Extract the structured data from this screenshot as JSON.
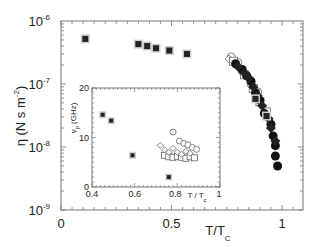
{
  "chart_data": [
    {
      "type": "scatter",
      "title": "",
      "xlabel": "T/T",
      "xlabel_sub": "C",
      "ylabel": "η (N s m",
      "ylabel_sup": "-2",
      "ylabel_close": ")",
      "yscale": "log",
      "xlim": [
        0,
        1.1
      ],
      "ylim": [
        1e-09,
        1e-06
      ],
      "x_ticks": [
        {
          "value": 0,
          "label": "0"
        },
        {
          "value": 0.5,
          "label": "0.5"
        },
        {
          "value": 1,
          "label": "1"
        }
      ],
      "y_ticks": [
        {
          "exp": -6,
          "base": "10",
          "sup": "-6"
        },
        {
          "exp": -7,
          "base": "10",
          "sup": "-7"
        },
        {
          "exp": -8,
          "base": "10",
          "sup": "-8"
        },
        {
          "exp": -9,
          "base": "10",
          "sup": "-9"
        }
      ],
      "grid": false,
      "series": [
        {
          "name": "filled squares (gray outline)",
          "marker": "square-filled",
          "points": [
            [
              0.11,
              5.2e-07
            ],
            [
              0.35,
              4.3e-07
            ],
            [
              0.39,
              4e-07
            ],
            [
              0.43,
              3.7e-07
            ],
            [
              0.49,
              3.4e-07
            ],
            [
              0.57,
              3e-07
            ],
            [
              0.88,
              5.8e-08
            ],
            [
              0.93,
              3.1e-08
            ]
          ]
        },
        {
          "name": "open circles",
          "marker": "circle-open",
          "points": [
            [
              0.77,
              2.7e-07
            ],
            [
              0.8,
              2.2e-07
            ],
            [
              0.82,
              1.6e-07
            ],
            [
              0.86,
              1e-07
            ],
            [
              0.89,
              7.5e-08
            ]
          ]
        },
        {
          "name": "open squares",
          "marker": "square-open",
          "points": [
            [
              0.78,
              2.3e-07
            ],
            [
              0.83,
              1.4e-07
            ],
            [
              0.87,
              8.5e-08
            ],
            [
              0.9,
              5.2e-08
            ],
            [
              0.93,
              3.6e-08
            ]
          ]
        },
        {
          "name": "open diamonds",
          "marker": "diamond-open",
          "points": [
            [
              0.76,
              2.5e-07
            ],
            [
              0.81,
              1.8e-07
            ],
            [
              0.85,
              1.2e-07
            ],
            [
              0.88,
              8e-08
            ]
          ]
        },
        {
          "name": "filled circles",
          "marker": "circle-filled",
          "points": [
            [
              0.79,
              2.1e-07
            ],
            [
              0.82,
              1.7e-07
            ],
            [
              0.84,
              1.35e-07
            ],
            [
              0.86,
              1.1e-07
            ],
            [
              0.88,
              7.2e-08
            ],
            [
              0.9,
              5.5e-08
            ],
            [
              0.92,
              3.4e-08
            ],
            [
              0.95,
              2.3e-08
            ],
            [
              0.96,
              1.5e-08
            ],
            [
              0.97,
              1.05e-08
            ],
            [
              0.97,
              7.2e-09
            ],
            [
              0.98,
              5e-09
            ]
          ]
        },
        {
          "name": "filled diamonds",
          "marker": "diamond-filled",
          "points": [
            [
              0.8,
              1.9e-07
            ],
            [
              0.83,
              1.5e-07
            ],
            [
              0.85,
              1.25e-07
            ],
            [
              0.87,
              9e-08
            ],
            [
              0.89,
              6.5e-08
            ],
            [
              0.91,
              4.5e-08
            ],
            [
              0.94,
              2.8e-08
            ],
            [
              0.95,
              2e-08
            ],
            [
              0.97,
              1.25e-08
            ]
          ]
        }
      ]
    },
    {
      "type": "scatter",
      "title": "inset",
      "xlabel": "T / T",
      "xlabel_sub": "c",
      "ylabel": "ν",
      "ylabel_sub": "p",
      "ylabel_unit": "(GHz)",
      "xlim": [
        0.4,
        1.0
      ],
      "ylim": [
        0,
        20
      ],
      "x_ticks": [
        {
          "value": 0.4,
          "label": "0.4"
        },
        {
          "value": 0.6,
          "label": "0.6"
        },
        {
          "value": 0.8,
          "label": "0.8"
        },
        {
          "value": 1.0,
          "label": "1"
        }
      ],
      "y_ticks": [
        {
          "value": 0,
          "label": "0"
        },
        {
          "value": 10,
          "label": "10"
        },
        {
          "value": 20,
          "label": "20"
        }
      ],
      "grid": false,
      "series": [
        {
          "name": "filled squares",
          "marker": "square-filled",
          "points": [
            [
              0.45,
              14.6
            ],
            [
              0.49,
              13.4
            ],
            [
              0.59,
              6.4
            ],
            [
              0.76,
              2.0
            ]
          ]
        },
        {
          "name": "open circles",
          "marker": "circle-open",
          "points": [
            [
              0.78,
              11.1
            ],
            [
              0.81,
              9.3
            ],
            [
              0.83,
              8.8
            ],
            [
              0.85,
              8.5
            ],
            [
              0.87,
              8.0
            ],
            [
              0.89,
              7.6
            ]
          ]
        },
        {
          "name": "open diamonds",
          "marker": "diamond-open",
          "points": [
            [
              0.72,
              8.4
            ],
            [
              0.74,
              7.5
            ],
            [
              0.76,
              7.0
            ],
            [
              0.78,
              7.8
            ],
            [
              0.8,
              7.0
            ],
            [
              0.82,
              6.6
            ],
            [
              0.84,
              7.2
            ],
            [
              0.86,
              6.8
            ]
          ]
        },
        {
          "name": "open squares",
          "marker": "square-open",
          "points": [
            [
              0.74,
              6.4
            ],
            [
              0.76,
              6.1
            ],
            [
              0.78,
              6.0
            ],
            [
              0.8,
              6.2
            ],
            [
              0.82,
              6.0
            ],
            [
              0.84,
              5.8
            ],
            [
              0.86,
              6.1
            ],
            [
              0.88,
              5.9
            ]
          ]
        }
      ]
    }
  ]
}
